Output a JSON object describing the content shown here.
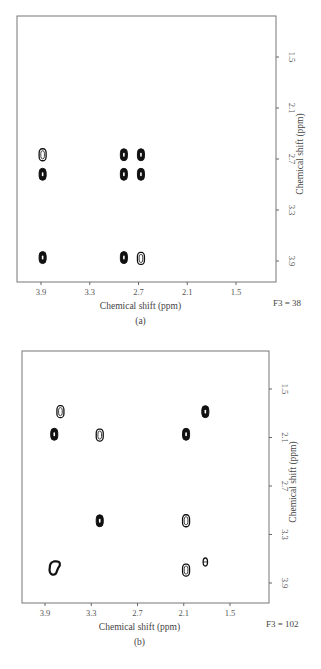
{
  "chart_data": [
    {
      "type": "scatter",
      "subtype": "2D NMR contour plot",
      "panel_label": "(a)",
      "annotation": "F3 = 38",
      "xlabel": "Chemical shift (ppm)",
      "ylabel": "Chemical shift (ppm)",
      "x_ticks": [
        "3.9",
        "3.3",
        "2.7",
        "2.1",
        "1.5"
      ],
      "y_ticks": [
        "1.5",
        "2.1",
        "2.7",
        "3.3",
        "3.9"
      ],
      "xlim": [
        4.2,
        1.0
      ],
      "ylim": [
        1.0,
        4.2
      ],
      "x_reversed": true,
      "y_position": "right",
      "grid": false,
      "peaks": [
        {
          "x": 3.88,
          "y": 2.65,
          "style": "open"
        },
        {
          "x": 3.88,
          "y": 2.88,
          "style": "filled"
        },
        {
          "x": 2.88,
          "y": 2.65,
          "style": "filled"
        },
        {
          "x": 2.88,
          "y": 2.88,
          "style": "filled"
        },
        {
          "x": 2.67,
          "y": 2.65,
          "style": "filled"
        },
        {
          "x": 2.67,
          "y": 2.88,
          "style": "filled"
        },
        {
          "x": 3.88,
          "y": 3.86,
          "style": "filled"
        },
        {
          "x": 2.88,
          "y": 3.86,
          "style": "filled"
        },
        {
          "x": 2.67,
          "y": 3.87,
          "style": "open"
        }
      ]
    },
    {
      "type": "scatter",
      "subtype": "2D NMR contour plot",
      "panel_label": "(b)",
      "annotation": "F3 = 102",
      "xlabel": "Chemical shift (ppm)",
      "ylabel": "Chemical shift (ppm)",
      "x_ticks": [
        "3.9",
        "3.3",
        "2.7",
        "2.1",
        "1.5"
      ],
      "y_ticks": [
        "1.5",
        "2.1",
        "2.7",
        "3.3",
        "3.9"
      ],
      "xlim": [
        4.2,
        1.0
      ],
      "ylim": [
        1.0,
        4.2
      ],
      "x_reversed": true,
      "y_position": "right",
      "grid": false,
      "peaks": [
        {
          "x": 3.7,
          "y": 1.78,
          "style": "open"
        },
        {
          "x": 3.78,
          "y": 2.06,
          "style": "filled"
        },
        {
          "x": 3.19,
          "y": 2.07,
          "style": "open"
        },
        {
          "x": 2.07,
          "y": 2.06,
          "style": "filled"
        },
        {
          "x": 1.82,
          "y": 1.78,
          "style": "filled"
        },
        {
          "x": 3.19,
          "y": 3.13,
          "style": "filled"
        },
        {
          "x": 2.07,
          "y": 3.13,
          "style": "open"
        },
        {
          "x": 3.76,
          "y": 3.72,
          "style": "irregular"
        },
        {
          "x": 2.07,
          "y": 3.74,
          "style": "open"
        },
        {
          "x": 1.82,
          "y": 3.64,
          "style": "open-small"
        }
      ]
    }
  ],
  "panels": [
    {
      "label": "(a)",
      "annotation": "F3 = 38",
      "xlabel": "Chemical shift (ppm)",
      "ylabel": "Chemical shift (ppm)",
      "frame": {
        "x0": 17,
        "y0": 16,
        "x1": 276,
        "y1": 282
      },
      "xmap": {
        "v0": 3.9,
        "p0": 41,
        "v1": 1.5,
        "p1": 236
      },
      "ymap": {
        "v0": 1.5,
        "p0": 57,
        "v1": 3.9,
        "p1": 261
      }
    },
    {
      "label": "(b)",
      "annotation": "F3 = 102",
      "xlabel": "Chemical shift (ppm)",
      "ylabel": "Chemical shift (ppm)",
      "frame": {
        "x0": 22,
        "y0": 351,
        "x1": 269,
        "y1": 603
      },
      "xmap": {
        "v0": 3.9,
        "p0": 45,
        "v1": 1.5,
        "p1": 230
      },
      "ymap": {
        "v0": 1.5,
        "p0": 389,
        "v1": 3.9,
        "p1": 583
      }
    }
  ]
}
